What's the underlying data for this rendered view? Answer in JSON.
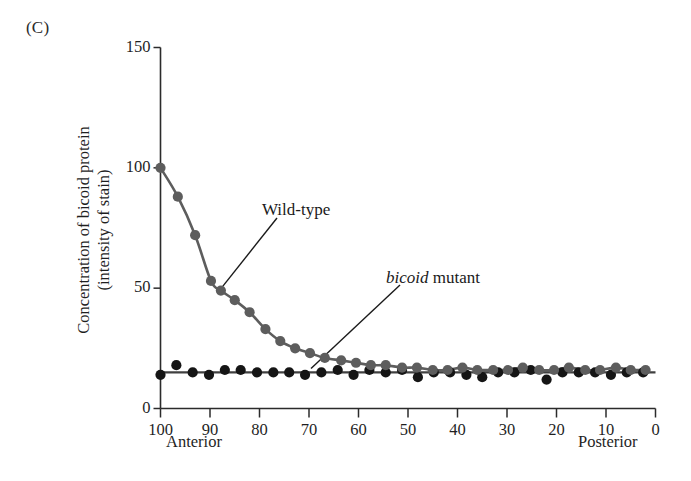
{
  "panel": {
    "label": "(C)"
  },
  "annotations": {
    "wild_type": "Wild-type",
    "bicoid_mutant_italic": "bicoid",
    "bicoid_mutant_rest": " mutant"
  },
  "axis_ends": {
    "left": "Anterior",
    "right": "Posterior"
  },
  "colors": {
    "wild_type": "#5d5d5d",
    "mutant": "#151515",
    "axis": "#2b2b2b",
    "background": "#ffffff"
  },
  "chart_data": {
    "type": "scatter",
    "title": "",
    "subtitle": "",
    "xlabel": "",
    "ylabel": "Concentration of bicoid protein (intensity of stain)",
    "ylabel_lines": [
      "Concentration of bicoid protein",
      "(intensity of stain)"
    ],
    "xlim": [
      100,
      0
    ],
    "ylim": [
      0,
      150
    ],
    "x_ticks": [
      100,
      90,
      80,
      70,
      60,
      50,
      40,
      30,
      20,
      10,
      0
    ],
    "x_tick_labels": [
      "100",
      "90",
      "80",
      "70",
      "60",
      "50",
      "40",
      "30",
      "20",
      "10",
      "0"
    ],
    "y_ticks": [
      0,
      50,
      100,
      150
    ],
    "y_tick_labels": [
      "0",
      "50",
      "100",
      "150"
    ],
    "x_axis_inverted": true,
    "grid": false,
    "legend": "annotations-inline",
    "x_end_labels": {
      "left": "Anterior",
      "right": "Posterior"
    },
    "series": [
      {
        "name": "Wild-type",
        "marker": "filled-circle",
        "color": "#5d5d5d",
        "line": true,
        "points": [
          [
            100.0,
            100
          ],
          [
            96.5,
            88
          ],
          [
            93.0,
            72
          ],
          [
            89.8,
            53
          ],
          [
            87.8,
            49
          ],
          [
            85.0,
            45
          ],
          [
            82.0,
            40
          ],
          [
            78.8,
            33
          ],
          [
            75.8,
            28
          ],
          [
            72.8,
            25
          ],
          [
            69.8,
            23
          ],
          [
            66.8,
            21
          ],
          [
            63.5,
            20
          ],
          [
            60.5,
            19
          ],
          [
            57.5,
            18
          ],
          [
            54.5,
            18
          ],
          [
            51.2,
            17
          ],
          [
            48.2,
            17
          ],
          [
            45.0,
            16
          ],
          [
            42.0,
            16
          ],
          [
            39.0,
            17
          ],
          [
            36.0,
            16
          ],
          [
            32.8,
            16
          ],
          [
            29.8,
            16
          ],
          [
            26.8,
            17
          ],
          [
            23.5,
            16
          ],
          [
            20.5,
            16
          ],
          [
            17.5,
            17
          ],
          [
            14.2,
            16
          ],
          [
            11.2,
            16
          ],
          [
            8.0,
            17
          ],
          [
            5.0,
            16
          ],
          [
            2.0,
            16
          ]
        ]
      },
      {
        "name": "bicoid mutant",
        "marker": "filled-circle",
        "color": "#151515",
        "line": true,
        "points": [
          [
            100.0,
            14
          ],
          [
            96.8,
            18
          ],
          [
            93.5,
            15
          ],
          [
            90.2,
            14
          ],
          [
            87.0,
            16
          ],
          [
            83.8,
            16
          ],
          [
            80.5,
            15
          ],
          [
            77.2,
            15
          ],
          [
            74.0,
            15
          ],
          [
            70.8,
            14
          ],
          [
            67.5,
            15
          ],
          [
            64.2,
            16
          ],
          [
            61.0,
            14
          ],
          [
            57.8,
            16
          ],
          [
            54.5,
            15
          ],
          [
            51.2,
            16
          ],
          [
            48.0,
            13
          ],
          [
            44.8,
            15
          ],
          [
            41.5,
            15
          ],
          [
            38.2,
            14
          ],
          [
            35.0,
            13
          ],
          [
            31.8,
            15
          ],
          [
            28.5,
            15
          ],
          [
            25.2,
            16
          ],
          [
            22.0,
            12
          ],
          [
            18.8,
            15
          ],
          [
            15.5,
            15
          ],
          [
            12.2,
            15
          ],
          [
            9.0,
            14
          ],
          [
            5.8,
            15
          ],
          [
            2.5,
            15
          ]
        ]
      }
    ],
    "trend_lines": [
      {
        "name": "Wild-type smooth",
        "color": "#5d5d5d"
      },
      {
        "name": "bicoid mutant baseline",
        "color": "#404040",
        "y": 15
      }
    ],
    "leader_lines": [
      {
        "label": "Wild-type",
        "target_series": "Wild-type",
        "target_x": 88,
        "target_y": 50
      },
      {
        "label": "bicoid mutant",
        "target_series": "bicoid mutant",
        "target_x": 70,
        "target_y": 15
      }
    ]
  }
}
